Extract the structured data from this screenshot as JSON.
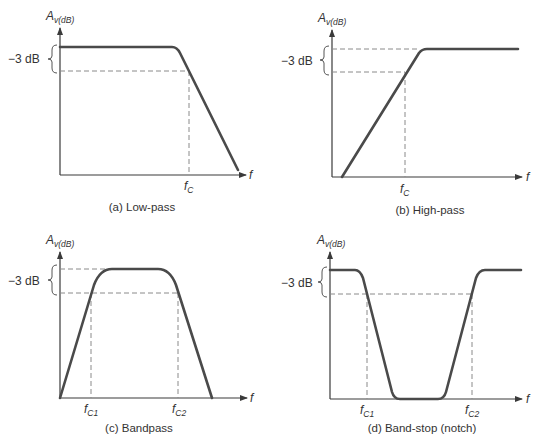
{
  "panels": [
    {
      "id": "a",
      "caption": "(a)  Low-pass",
      "y_label": "A",
      "y_label_sub": "v(dB)",
      "x_label": "f",
      "db_label": "−3 dB",
      "cutoffs": [
        {
          "label": "f",
          "sub": "C"
        }
      ]
    },
    {
      "id": "b",
      "caption": "(b)  High-pass",
      "y_label": "A",
      "y_label_sub": "v(dB)",
      "x_label": "f",
      "db_label": "−3 dB",
      "cutoffs": [
        {
          "label": "f",
          "sub": "C"
        }
      ]
    },
    {
      "id": "c",
      "caption": "(c)  Bandpass",
      "y_label": "A",
      "y_label_sub": "v(dB)",
      "x_label": "f",
      "db_label": "−3 dB",
      "cutoffs": [
        {
          "label": "f",
          "sub": "C1"
        },
        {
          "label": "f",
          "sub": "C2"
        }
      ]
    },
    {
      "id": "d",
      "caption": "(d)  Band-stop (notch)",
      "y_label": "A",
      "y_label_sub": "v(dB)",
      "x_label": "f",
      "db_label": "−3 dB",
      "cutoffs": [
        {
          "label": "f",
          "sub": "C1"
        },
        {
          "label": "f",
          "sub": "C2"
        }
      ]
    }
  ],
  "colors": {
    "curve": "#4a4a4a",
    "axis": "#3a3a3a",
    "dashed": "#8a8a8a",
    "text": "#333333"
  }
}
